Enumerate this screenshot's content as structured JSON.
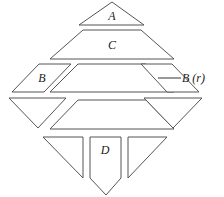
{
  "diagram": {
    "title": "",
    "width": 224,
    "height": 197,
    "stroke_color": "#555555",
    "label_color": "#222222",
    "pieces": [
      {
        "id": "A",
        "name": "piece-a-triangle",
        "label": "A",
        "points": "112,2 144,25 79,25",
        "label_x": 112,
        "label_y": 20
      },
      {
        "id": "C",
        "name": "piece-c-trapezoid",
        "label": "C",
        "points": "83,30 141,30 174,59 50,59",
        "label_x": 112,
        "label_y": 49
      },
      {
        "id": "B",
        "name": "piece-b-parallelogram",
        "label": "B",
        "points": "39,64 71,64 44,92 12,92",
        "label_x": 42,
        "label_y": 82
      },
      {
        "id": "mid1",
        "name": "piece-middle-trapezoid-upper",
        "label": "",
        "points": "78,64 146,64 174,92 50,92",
        "label_x": 112,
        "label_y": 80
      },
      {
        "id": "Br",
        "name": "piece-b-r-parallelogram",
        "label": "",
        "points": "141,64 172,64 199,92 167,92",
        "label_x": 170,
        "label_y": 80
      },
      {
        "id": "left_tri",
        "name": "piece-left-inverted-triangle",
        "label": "",
        "points": "9,98 66,98 38,128",
        "label_x": 38,
        "label_y": 110
      },
      {
        "id": "mid2",
        "name": "piece-middle-trapezoid-lower",
        "label": "",
        "points": "78,100 146,100 174,129 50,129",
        "label_x": 112,
        "label_y": 116
      },
      {
        "id": "right_tri",
        "name": "piece-right-inverted-triangle",
        "label": "",
        "points": "144,98 202,98 173,128",
        "label_x": 173,
        "label_y": 110
      },
      {
        "id": "bottom_left_tri",
        "name": "piece-bottom-left-triangle",
        "label": "",
        "points": "43,137 83,137 83,178",
        "label_x": 70,
        "label_y": 150
      },
      {
        "id": "D",
        "name": "piece-d-pentagon",
        "label": "D",
        "points": "90,137 121,137 121,178 106,195 90,178",
        "label_x": 105,
        "label_y": 154
      },
      {
        "id": "bottom_right_tri",
        "name": "piece-bottom-right-triangle",
        "label": "",
        "points": "128,137 167,137 128,178",
        "label_x": 140,
        "label_y": 150
      }
    ],
    "callout": {
      "label": "B (r)",
      "text_x": 182,
      "text_y": 82,
      "line_x1": 158,
      "line_y1": 78,
      "line_x2": 181,
      "line_y2": 78
    }
  }
}
